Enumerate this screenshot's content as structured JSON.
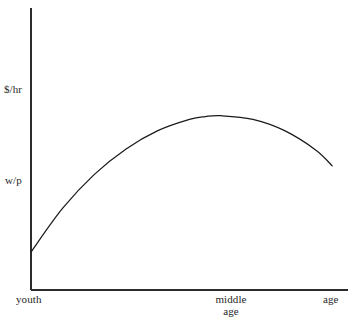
{
  "chart_data": {
    "type": "line",
    "title": "",
    "subtitle": "",
    "xlabel": "age",
    "ylabel": "$/hr",
    "grid": false,
    "legend": null,
    "axis_line_color": "#2b2b2b",
    "curve_color": "#1a1a1a",
    "background_color": "#ffffff",
    "xlim": [
      0,
      1
    ],
    "ylim": [
      0,
      1
    ],
    "x_tick_labels": [
      "youth",
      "middle age",
      "age"
    ],
    "y_tick_labels": [
      "$/hr",
      "w/p"
    ],
    "series": [
      {
        "name": "wage profile",
        "description": "concave hump-shaped age-earnings profile",
        "x": [
          0.0,
          0.1,
          0.2,
          0.3,
          0.4,
          0.5,
          0.55,
          0.6,
          0.7,
          0.8,
          0.9,
          0.95
        ],
        "y": [
          0.135,
          0.29,
          0.41,
          0.5,
          0.565,
          0.605,
          0.615,
          0.618,
          0.605,
          0.565,
          0.495,
          0.44
        ]
      }
    ]
  },
  "labels": {
    "y_dollar_hr": "$/hr",
    "y_wp": "w/p",
    "x_youth": "youth",
    "x_middle": "middle",
    "x_age_second_line": "age",
    "x_age_right": "age"
  },
  "icons": {
    "y_axis": "vertical-axis-line",
    "x_axis": "horizontal-axis-line",
    "curve": "concave-curve"
  }
}
